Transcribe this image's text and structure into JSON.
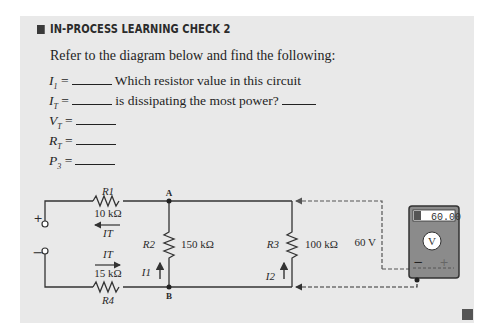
{
  "header": {
    "title": "IN-PROCESS LEARNING CHECK 2"
  },
  "intro": "Refer to the diagram below and find the following:",
  "questions": [
    {
      "var": "I",
      "sub": "1",
      "text": "=",
      "extra": "Which resistor value in this circuit"
    },
    {
      "var": "I",
      "sub": "T",
      "text": "=",
      "extra": "is dissipating the most power?"
    },
    {
      "var": "V",
      "sub": "T",
      "text": "=",
      "extra": ""
    },
    {
      "var": "R",
      "sub": "T",
      "text": "=",
      "extra": ""
    },
    {
      "var": "P",
      "sub": "3",
      "text": "=",
      "extra": ""
    }
  ],
  "circuit": {
    "r1": {
      "label": "R1",
      "value": "10 kΩ"
    },
    "r2": {
      "label": "R2",
      "value": "150 kΩ"
    },
    "r3": {
      "label": "R3",
      "value": "100 kΩ"
    },
    "r4": {
      "label": "R4",
      "value": "15 kΩ"
    },
    "node_a": "A",
    "node_b": "B",
    "current_total": "IT",
    "current_1": "I1",
    "current_2": "I2",
    "plus": "+",
    "minus": "−",
    "voltage_label": "60 V",
    "meter_display": "60.00",
    "meter_symbol": "V",
    "meter_minus": "−",
    "meter_plus": "+"
  },
  "colors": {
    "panel": "#e9e9e9",
    "meter_body": "#8b8b8b",
    "wire": "#333333"
  }
}
